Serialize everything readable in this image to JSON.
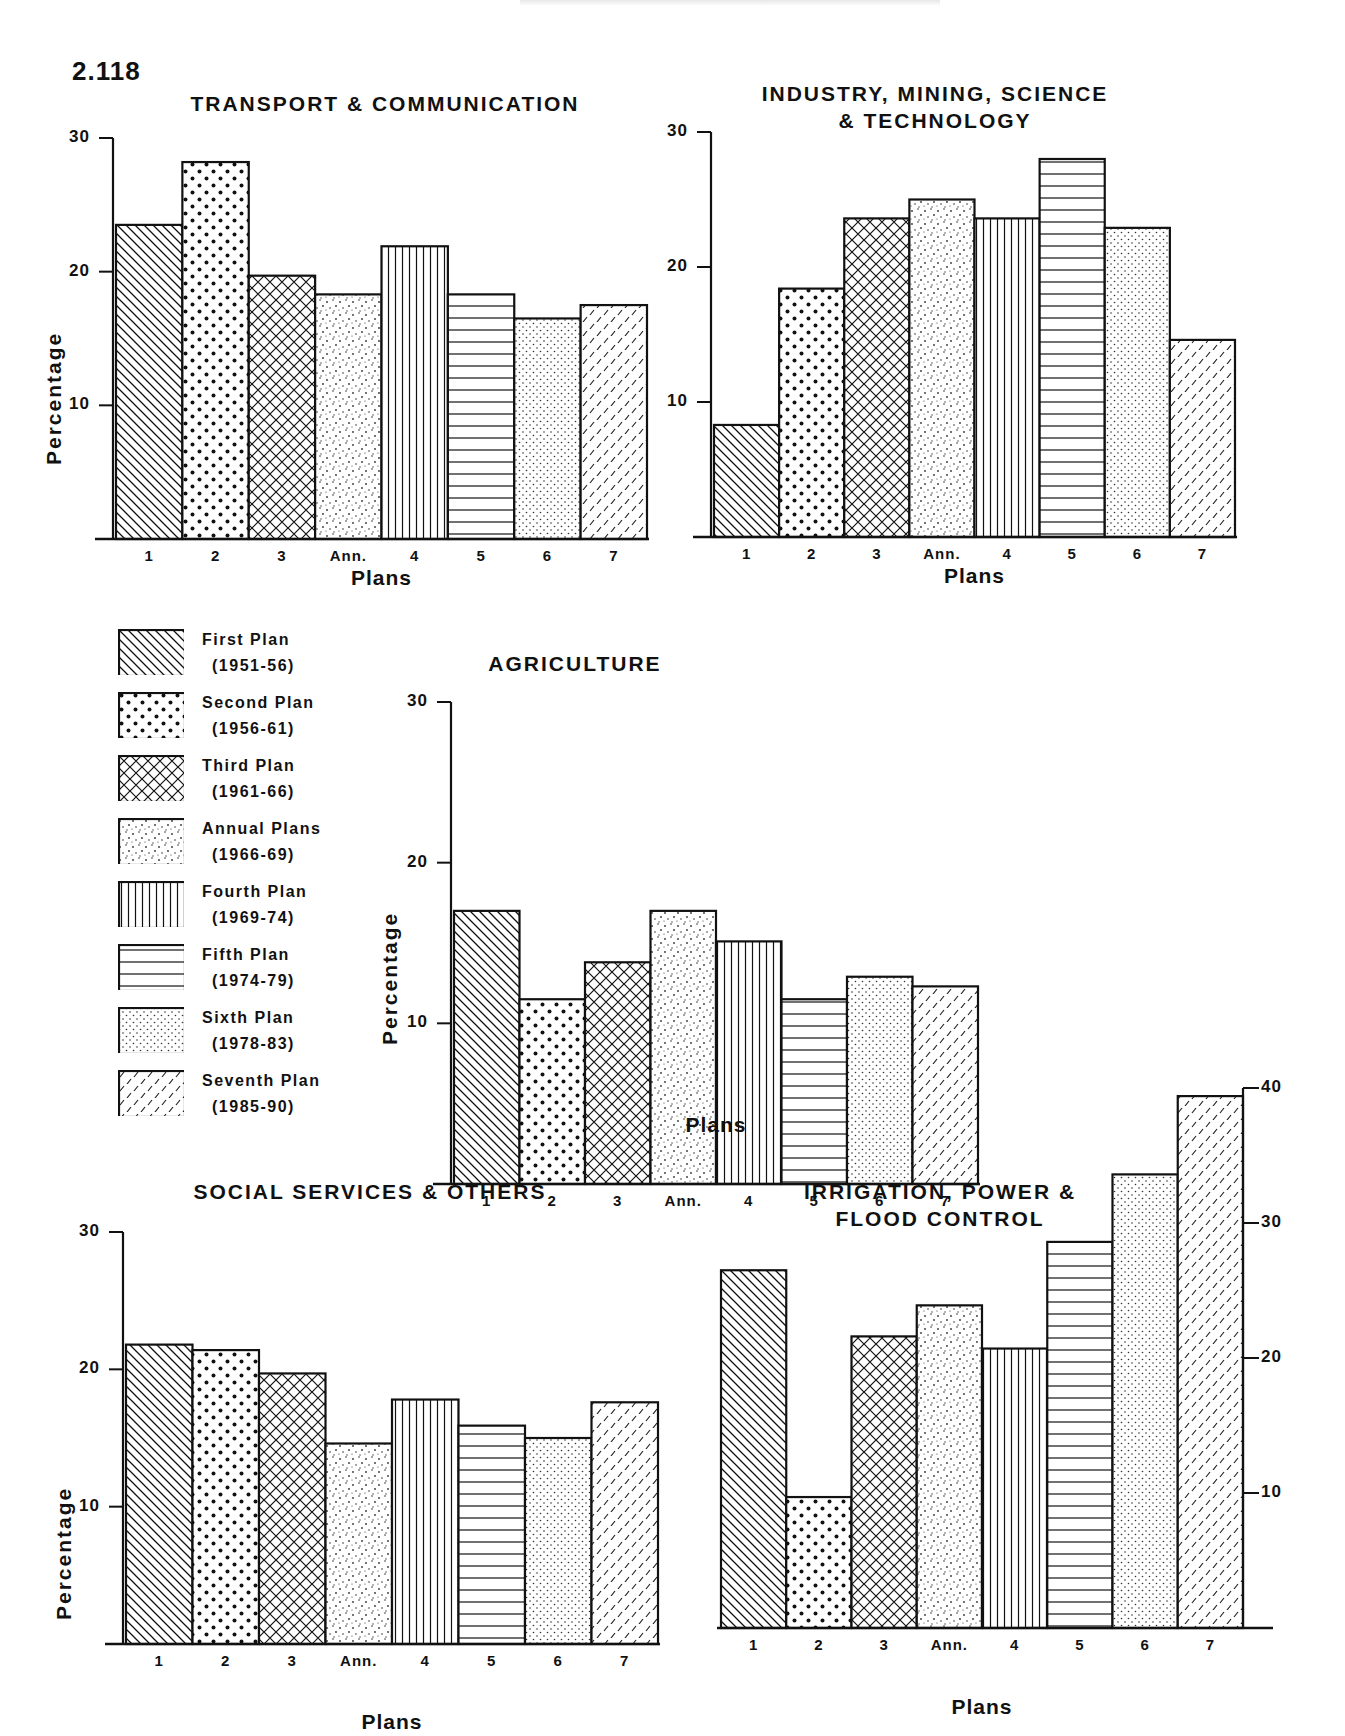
{
  "figure_number": "2.118",
  "legend": {
    "items": [
      {
        "key": "1",
        "name": "First Plan",
        "period": "(1951-56)",
        "pattern": "diag-back"
      },
      {
        "key": "2",
        "name": "Second Plan",
        "period": "(1956-61)",
        "pattern": "dots-big"
      },
      {
        "key": "3",
        "name": "Third Plan",
        "period": "(1961-66)",
        "pattern": "crosshatch"
      },
      {
        "key": "Ann.",
        "name": "Annual Plans",
        "period": "(1966-69)",
        "pattern": "stipple-sparse"
      },
      {
        "key": "4",
        "name": "Fourth Plan",
        "period": "(1969-74)",
        "pattern": "vertical"
      },
      {
        "key": "5",
        "name": "Fifth Plan",
        "period": "(1974-79)",
        "pattern": "horizontal"
      },
      {
        "key": "6",
        "name": "Sixth Plan",
        "period": "(1978-83)",
        "pattern": "stipple-fine"
      },
      {
        "key": "7",
        "name": "Seventh Plan",
        "period": "(1985-90)",
        "pattern": "dashes"
      }
    ]
  },
  "chart_data": [
    {
      "id": "transport",
      "type": "bar",
      "title": "TRANSPORT & COMMUNICATION",
      "title_lines": [
        "TRANSPORT & COMMUNICATION"
      ],
      "xlabel": "Plans",
      "ylabel": "Percentage",
      "categories": [
        "1",
        "2",
        "3",
        "Ann.",
        "4",
        "5",
        "6",
        "7"
      ],
      "values": [
        23.5,
        28.2,
        19.7,
        18.3,
        21.9,
        18.3,
        16.5,
        17.5
      ],
      "yticks": [
        10,
        20,
        30
      ],
      "ylim": [
        0,
        30
      ],
      "axis_side": "left",
      "grid": false
    },
    {
      "id": "industry",
      "type": "bar",
      "title": "INDUSTRY, MINING, SCIENCE & TECHNOLOGY",
      "title_lines": [
        "INDUSTRY, MINING, SCIENCE",
        "& TECHNOLOGY"
      ],
      "xlabel": "Plans",
      "ylabel": "",
      "categories": [
        "1",
        "2",
        "3",
        "Ann.",
        "4",
        "5",
        "6",
        "7"
      ],
      "values": [
        8.3,
        18.4,
        23.6,
        25.0,
        23.6,
        28.0,
        22.9,
        14.6
      ],
      "yticks": [
        10,
        20,
        30
      ],
      "ylim": [
        0,
        30
      ],
      "axis_side": "left",
      "grid": false
    },
    {
      "id": "agriculture",
      "type": "bar",
      "title": "AGRICULTURE",
      "title_lines": [
        "AGRICULTURE"
      ],
      "xlabel": "Plans",
      "ylabel": "Percentage",
      "categories": [
        "1",
        "2",
        "3",
        "Ann.",
        "4",
        "5",
        "6",
        "7"
      ],
      "values": [
        17.0,
        11.5,
        13.8,
        17.0,
        15.1,
        11.5,
        12.9,
        12.3
      ],
      "yticks": [
        10,
        20,
        30
      ],
      "ylim": [
        0,
        30
      ],
      "axis_side": "left",
      "grid": false
    },
    {
      "id": "social",
      "type": "bar",
      "title": "SOCIAL SERVICES & OTHERS",
      "title_lines": [
        "SOCIAL SERVICES & OTHERS"
      ],
      "xlabel": "Plans",
      "ylabel": "Percentage",
      "categories": [
        "1",
        "2",
        "3",
        "Ann.",
        "4",
        "5",
        "6",
        "7"
      ],
      "values": [
        21.8,
        21.4,
        19.7,
        14.6,
        17.8,
        15.9,
        15.0,
        17.6
      ],
      "yticks": [
        10,
        20,
        30
      ],
      "ylim": [
        0,
        30
      ],
      "axis_side": "left",
      "grid": false
    },
    {
      "id": "irrigation",
      "type": "bar",
      "title": "IRRIGATION, POWER & FLOOD CONTROL",
      "title_lines": [
        "IRRIGATION, POWER &",
        "FLOOD CONTROL"
      ],
      "xlabel": "Plans",
      "ylabel": "",
      "categories": [
        "1",
        "2",
        "3",
        "Ann.",
        "4",
        "5",
        "6",
        "7"
      ],
      "values": [
        26.5,
        9.7,
        21.6,
        23.9,
        20.7,
        28.6,
        33.6,
        39.4
      ],
      "yticks": [
        10,
        20,
        30,
        40
      ],
      "ylim": [
        0,
        40
      ],
      "axis_side": "right",
      "grid": false
    }
  ]
}
